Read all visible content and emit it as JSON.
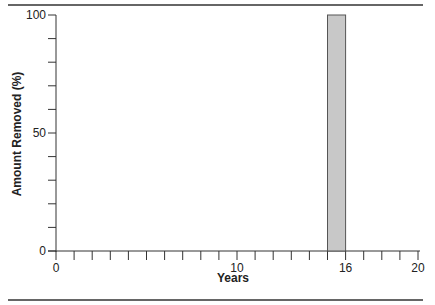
{
  "chart_data": {
    "type": "bar",
    "title": "",
    "xlabel": "Years",
    "ylabel": "Amount Removed (%)",
    "xlim": [
      0,
      20
    ],
    "ylim": [
      0,
      100
    ],
    "x_tick_labels": [
      "0",
      "10",
      "16",
      "20"
    ],
    "x_tick_values": [
      0,
      10,
      16,
      20
    ],
    "x_minor_step": 1,
    "y_tick_labels": [
      "0",
      "50",
      "100"
    ],
    "y_tick_values": [
      0,
      50,
      100
    ],
    "y_minor_step": 10,
    "bars": [
      {
        "x_start": 15,
        "x_end": 16,
        "value": 100
      }
    ],
    "grid": false,
    "legend": null,
    "colors": {
      "bar_fill": "#c8c8c8",
      "bar_stroke": "#555555",
      "axis": "#333333"
    }
  }
}
